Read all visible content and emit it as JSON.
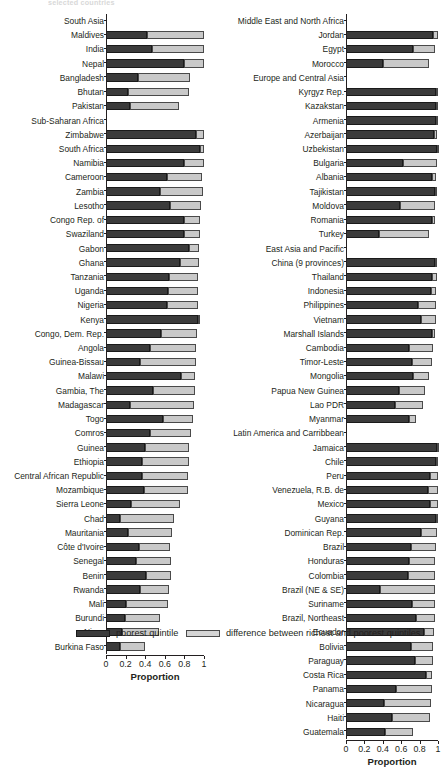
{
  "figure": {
    "partial_title": "selected countries",
    "legend": [
      {
        "key": "poorest",
        "label": "poorest quintile",
        "swatch": "dark",
        "color": "#3b3b3b"
      },
      {
        "key": "difference",
        "label": "difference between richest and poorest quintiles",
        "swatch": "light",
        "color": "#c9c9c9"
      }
    ]
  },
  "chart_data": {
    "type": "bar",
    "orientation": "horizontal",
    "stacked": true,
    "title": "selected countries",
    "xlabel": "Proportion",
    "ylabel": "",
    "xlim": [
      0,
      1
    ],
    "xticks": [
      0,
      0.2,
      0.4,
      0.6,
      0.8,
      1
    ],
    "xticklabels": [
      "0",
      "0.2",
      "0.4",
      "0.6",
      "0.8",
      "1"
    ],
    "grid": false,
    "legend_position": "bottom",
    "series": [
      {
        "name": "poorest quintile",
        "color": "#3b3b3b"
      },
      {
        "name": "difference between richest and poorest quintiles",
        "color": "#c9c9c9"
      }
    ],
    "panels": [
      {
        "id": "left",
        "xlabel": "Proportion",
        "rows": [
          {
            "label": "South Asia",
            "group": true
          },
          {
            "label": "Maldives",
            "poorest": 0.42,
            "total": 1.0
          },
          {
            "label": "India",
            "poorest": 0.47,
            "total": 1.0
          },
          {
            "label": "Nepal",
            "poorest": 0.8,
            "total": 1.0
          },
          {
            "label": "Bangladesh",
            "poorest": 0.33,
            "total": 0.86
          },
          {
            "label": "Bhutan",
            "poorest": 0.22,
            "total": 0.85
          },
          {
            "label": "Pakistan",
            "poorest": 0.24,
            "total": 0.74
          },
          {
            "label": "Sub-Saharan Africa",
            "group": true
          },
          {
            "label": "Zimbabwe",
            "poorest": 0.92,
            "total": 1.0
          },
          {
            "label": "South Africa",
            "poorest": 0.96,
            "total": 1.0
          },
          {
            "label": "Namibia",
            "poorest": 0.8,
            "total": 1.0
          },
          {
            "label": "Cameroon",
            "poorest": 0.62,
            "total": 0.98
          },
          {
            "label": "Zambia",
            "poorest": 0.55,
            "total": 0.99
          },
          {
            "label": "Lesotho",
            "poorest": 0.65,
            "total": 0.97
          },
          {
            "label": "Congo Rep. of",
            "poorest": 0.8,
            "total": 0.96
          },
          {
            "label": "Swaziland",
            "poorest": 0.8,
            "total": 0.96
          },
          {
            "label": "Gabon",
            "poorest": 0.85,
            "total": 0.95
          },
          {
            "label": "Ghana",
            "poorest": 0.76,
            "total": 0.95
          },
          {
            "label": "Tanzania",
            "poorest": 0.64,
            "total": 0.94
          },
          {
            "label": "Uganda",
            "poorest": 0.63,
            "total": 0.94
          },
          {
            "label": "Nigeria",
            "poorest": 0.62,
            "total": 0.94
          },
          {
            "label": "Kenya",
            "poorest": 0.94,
            "total": 0.94
          },
          {
            "label": "Congo, Dem. Rep.",
            "poorest": 0.56,
            "total": 0.93
          },
          {
            "label": "Angola",
            "poorest": 0.45,
            "total": 0.92
          },
          {
            "label": "Guinea-Bissau",
            "poorest": 0.35,
            "total": 0.92
          },
          {
            "label": "Malawi",
            "poorest": 0.77,
            "total": 0.91
          },
          {
            "label": "Gambia, The",
            "poorest": 0.48,
            "total": 0.91
          },
          {
            "label": "Madagascar",
            "poorest": 0.24,
            "total": 0.9
          },
          {
            "label": "Togo",
            "poorest": 0.58,
            "total": 0.89
          },
          {
            "label": "Comros",
            "poorest": 0.45,
            "total": 0.87
          },
          {
            "label": "Guinea",
            "poorest": 0.4,
            "total": 0.85
          },
          {
            "label": "Ethiopia",
            "poorest": 0.37,
            "total": 0.85
          },
          {
            "label": "Central African Republic",
            "poorest": 0.37,
            "total": 0.84
          },
          {
            "label": "Mozambique",
            "poorest": 0.39,
            "total": 0.84
          },
          {
            "label": "Sierra Leone",
            "poorest": 0.26,
            "total": 0.76
          },
          {
            "label": "Chad",
            "poorest": 0.14,
            "total": 0.69
          },
          {
            "label": "Mauritania",
            "poorest": 0.22,
            "total": 0.67
          },
          {
            "label": "Côte d'Ivoire",
            "poorest": 0.34,
            "total": 0.65
          },
          {
            "label": "Senegal",
            "poorest": 0.31,
            "total": 0.66
          },
          {
            "label": "Benin",
            "poorest": 0.41,
            "total": 0.66
          },
          {
            "label": "Rwanda",
            "poorest": 0.35,
            "total": 0.64
          },
          {
            "label": "Mali",
            "poorest": 0.2,
            "total": 0.63
          },
          {
            "label": "Burundi",
            "poorest": 0.19,
            "total": 0.55
          },
          {
            "label": "Niger",
            "poorest": 0.16,
            "total": 0.54
          },
          {
            "label": "Burkina Faso",
            "poorest": 0.14,
            "total": 0.4
          }
        ]
      },
      {
        "id": "right",
        "xlabel": "Proportion",
        "rows": [
          {
            "label": "Middle East and North Africa",
            "group": true
          },
          {
            "label": "Jordan",
            "poorest": 0.95,
            "total": 1.0
          },
          {
            "label": "Egypt",
            "poorest": 0.73,
            "total": 0.97
          },
          {
            "label": "Morocco",
            "poorest": 0.4,
            "total": 0.9
          },
          {
            "label": "Europe and Central Asia",
            "group": true
          },
          {
            "label": "Kyrgyz Rep.",
            "poorest": 0.98,
            "total": 1.0
          },
          {
            "label": "Kazakstan",
            "poorest": 0.98,
            "total": 1.0
          },
          {
            "label": "Armenia",
            "poorest": 0.98,
            "total": 1.0
          },
          {
            "label": "Azerbaijan",
            "poorest": 0.96,
            "total": 0.99
          },
          {
            "label": "Uzbekistan",
            "poorest": 0.99,
            "total": 0.99
          },
          {
            "label": "Bulgaria",
            "poorest": 0.62,
            "total": 0.99
          },
          {
            "label": "Albania",
            "poorest": 0.93,
            "total": 0.98
          },
          {
            "label": "Tajikistan",
            "poorest": 0.97,
            "total": 0.97
          },
          {
            "label": "Moldova",
            "poorest": 0.59,
            "total": 0.97
          },
          {
            "label": "Romania",
            "poorest": 0.94,
            "total": 0.97
          },
          {
            "label": "Turkey",
            "poorest": 0.36,
            "total": 0.9
          },
          {
            "label": "East Asia and Pacific",
            "group": true
          },
          {
            "label": "China (9 provinces)",
            "poorest": 0.97,
            "total": 0.99
          },
          {
            "label": "Thailand",
            "poorest": 0.94,
            "total": 0.99
          },
          {
            "label": "Indonesia",
            "poorest": 0.92,
            "total": 0.98
          },
          {
            "label": "Philippines",
            "poorest": 0.78,
            "total": 0.98
          },
          {
            "label": "Vietnam",
            "poorest": 0.82,
            "total": 0.98
          },
          {
            "label": "Marshall Islands",
            "poorest": 0.94,
            "total": 0.97
          },
          {
            "label": "Cambodia",
            "poorest": 0.69,
            "total": 0.95
          },
          {
            "label": "Timor-Leste",
            "poorest": 0.72,
            "total": 0.93
          },
          {
            "label": "Mongolia",
            "poorest": 0.73,
            "total": 0.9
          },
          {
            "label": "Papua New Guinea",
            "poorest": 0.58,
            "total": 0.86
          },
          {
            "label": "Lao PDR",
            "poorest": 0.53,
            "total": 0.84
          },
          {
            "label": "Myanmar",
            "poorest": 0.68,
            "total": 0.76
          },
          {
            "label": "Latin America and Carribbean",
            "group": true
          },
          {
            "label": "Jamaica",
            "poorest": 0.99,
            "total": 1.0
          },
          {
            "label": "Chile",
            "poorest": 0.98,
            "total": 1.0
          },
          {
            "label": "Peru",
            "poorest": 0.91,
            "total": 1.0
          },
          {
            "label": "Venezuela, R.B. de",
            "poorest": 0.89,
            "total": 1.0
          },
          {
            "label": "Mexico",
            "poorest": 0.91,
            "total": 1.0
          },
          {
            "label": "Guyana",
            "poorest": 0.98,
            "total": 1.0
          },
          {
            "label": "Dominican Rep.",
            "poorest": 0.81,
            "total": 0.99
          },
          {
            "label": "Brazil",
            "poorest": 0.71,
            "total": 0.98
          },
          {
            "label": "Honduras",
            "poorest": 0.69,
            "total": 0.97
          },
          {
            "label": "Colombia",
            "poorest": 0.67,
            "total": 0.97
          },
          {
            "label": "Brazil (NE & SE)",
            "poorest": 0.37,
            "total": 0.97
          },
          {
            "label": "Suriname",
            "poorest": 0.72,
            "total": 0.97
          },
          {
            "label": "Brazil, Northeast",
            "poorest": 0.76,
            "total": 0.97
          },
          {
            "label": "Ecuador",
            "poorest": 0.85,
            "total": 0.96
          },
          {
            "label": "Bolivia",
            "poorest": 0.71,
            "total": 0.95
          },
          {
            "label": "Paraguay",
            "poorest": 0.75,
            "total": 0.95
          },
          {
            "label": "Costa Rica",
            "poorest": 0.87,
            "total": 0.94
          },
          {
            "label": "Panama",
            "poorest": 0.54,
            "total": 0.93
          },
          {
            "label": "Nicaragua",
            "poorest": 0.41,
            "total": 0.92
          },
          {
            "label": "Haiti",
            "poorest": 0.5,
            "total": 0.91
          },
          {
            "label": "Guatemala",
            "poorest": 0.42,
            "total": 0.73
          }
        ]
      }
    ]
  }
}
